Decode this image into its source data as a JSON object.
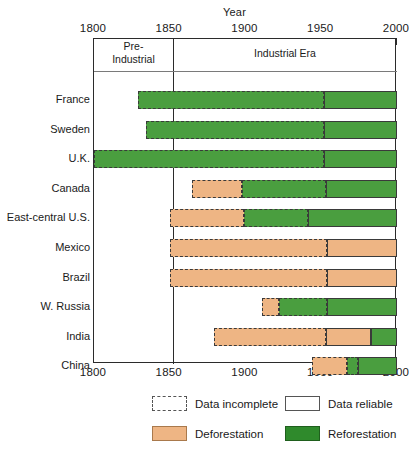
{
  "chart_data": {
    "type": "bar",
    "title": "",
    "xlabel": "Year",
    "ylabel": "",
    "xlim": [
      1800,
      2000
    ],
    "xticks": [
      1800,
      1850,
      1900,
      1950,
      2000
    ],
    "xtick_labels": [
      "1800",
      "1850",
      "1900",
      "1950",
      "2000"
    ],
    "grid": false,
    "orientation": "horizontal",
    "era_divider_year": 1850,
    "eras": [
      {
        "label": "Pre-Industrial",
        "start": 1800,
        "end": 1850
      },
      {
        "label": "Industrial Era",
        "start": 1850,
        "end": 2000
      }
    ],
    "categories": [
      "France",
      "Sweden",
      "U.K.",
      "Canada",
      "East-central U.S.",
      "Mexico",
      "Brazil",
      "W. Russia",
      "India",
      "China"
    ],
    "series": [
      {
        "country": "France",
        "segments": [
          {
            "phase": "Reforestation",
            "reliability": "Data incomplete",
            "start": 1829,
            "end": 1952
          },
          {
            "phase": "Reforestation",
            "reliability": "Data reliable",
            "start": 1952,
            "end": 2000
          }
        ]
      },
      {
        "country": "Sweden",
        "segments": [
          {
            "phase": "Reforestation",
            "reliability": "Data incomplete",
            "start": 1834,
            "end": 1952
          },
          {
            "phase": "Reforestation",
            "reliability": "Data reliable",
            "start": 1952,
            "end": 2000
          }
        ]
      },
      {
        "country": "U.K.",
        "segments": [
          {
            "phase": "Reforestation",
            "reliability": "Data incomplete",
            "start": 1800,
            "end": 1952
          },
          {
            "phase": "Reforestation",
            "reliability": "Data reliable",
            "start": 1952,
            "end": 2000
          }
        ]
      },
      {
        "country": "Canada",
        "segments": [
          {
            "phase": "Deforestation",
            "reliability": "Data incomplete",
            "start": 1865,
            "end": 1898
          },
          {
            "phase": "Reforestation",
            "reliability": "Data incomplete",
            "start": 1898,
            "end": 1953
          },
          {
            "phase": "Reforestation",
            "reliability": "Data reliable",
            "start": 1953,
            "end": 2000
          }
        ]
      },
      {
        "country": "East-central U.S.",
        "segments": [
          {
            "phase": "Deforestation",
            "reliability": "Data incomplete",
            "start": 1850,
            "end": 1899
          },
          {
            "phase": "Reforestation",
            "reliability": "Data incomplete",
            "start": 1899,
            "end": 1941
          },
          {
            "phase": "Reforestation",
            "reliability": "Data reliable",
            "start": 1941,
            "end": 2000
          }
        ]
      },
      {
        "country": "Mexico",
        "segments": [
          {
            "phase": "Deforestation",
            "reliability": "Data incomplete",
            "start": 1850,
            "end": 1954
          },
          {
            "phase": "Deforestation",
            "reliability": "Data reliable",
            "start": 1954,
            "end": 2000
          }
        ]
      },
      {
        "country": "Brazil",
        "segments": [
          {
            "phase": "Deforestation",
            "reliability": "Data incomplete",
            "start": 1850,
            "end": 1954
          },
          {
            "phase": "Deforestation",
            "reliability": "Data reliable",
            "start": 1954,
            "end": 2000
          }
        ]
      },
      {
        "country": "W. Russia",
        "segments": [
          {
            "phase": "Deforestation",
            "reliability": "Data incomplete",
            "start": 1911,
            "end": 1922
          },
          {
            "phase": "Reforestation",
            "reliability": "Data incomplete",
            "start": 1922,
            "end": 1954
          },
          {
            "phase": "Reforestation",
            "reliability": "Data reliable",
            "start": 1954,
            "end": 2000
          }
        ]
      },
      {
        "country": "India",
        "segments": [
          {
            "phase": "Deforestation",
            "reliability": "Data incomplete",
            "start": 1879,
            "end": 1953
          },
          {
            "phase": "Deforestation",
            "reliability": "Data reliable",
            "start": 1953,
            "end": 1983
          },
          {
            "phase": "Reforestation",
            "reliability": "Data reliable",
            "start": 1983,
            "end": 2000
          }
        ]
      },
      {
        "country": "China",
        "segments": [
          {
            "phase": "Deforestation",
            "reliability": "Data incomplete",
            "start": 1944,
            "end": 1967
          },
          {
            "phase": "Reforestation",
            "reliability": "Data incomplete",
            "start": 1967,
            "end": 1974
          },
          {
            "phase": "Reforestation",
            "reliability": "Data reliable",
            "start": 1974,
            "end": 2000
          }
        ]
      }
    ],
    "legend": {
      "position": "bottom",
      "entries": [
        {
          "label": "Data incomplete",
          "style": "dashed-outline",
          "color": "#ffffff"
        },
        {
          "label": "Data reliable",
          "style": "solid-outline",
          "color": "#ffffff"
        },
        {
          "label": "Deforestation",
          "style": "filled",
          "color": "#eeb584"
        },
        {
          "label": "Reforestation",
          "style": "filled",
          "color": "#2f8a2c"
        }
      ]
    },
    "colors": {
      "deforestation": "#eeb584",
      "reforestation": "#4a9e3f",
      "axis": "#2b2b2b",
      "background": "#ffffff"
    }
  },
  "axis": {
    "title": "Year",
    "tick_labels_top": [
      "1800",
      "1850",
      "1900",
      "1950",
      "2000"
    ],
    "tick_labels_bottom": [
      "1800",
      "1850",
      "1900",
      "1950",
      "2000"
    ]
  },
  "eras": {
    "pre_industrial": "Pre-\nIndustrial",
    "pre_industrial_line1": "Pre-",
    "pre_industrial_line2": "Industrial",
    "industrial": "Industrial Era"
  },
  "legend": {
    "incomplete": "Data incomplete",
    "reliable": "Data reliable",
    "deforestation": "Deforestation",
    "reforestation": "Reforestation"
  }
}
